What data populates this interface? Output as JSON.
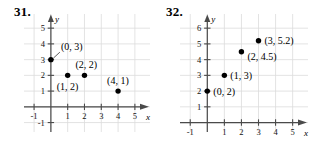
{
  "figures": [
    {
      "number": "31.",
      "chart_data": {
        "type": "scatter",
        "title": "",
        "xlabel": "x",
        "ylabel": "y",
        "grid": true,
        "legend": "none",
        "xlim": [
          -1.6,
          5.9
        ],
        "ylim": [
          -1.6,
          5.9
        ],
        "xticks": [
          -1,
          1,
          2,
          3,
          4,
          5
        ],
        "xtick_labels": [
          "-1",
          "1",
          "2",
          "3",
          "4",
          "5"
        ],
        "yticks": [
          -1,
          1,
          2,
          3,
          4,
          5
        ],
        "ytick_labels": [
          "-1",
          "1",
          "2",
          "3",
          "4",
          "5"
        ],
        "points": [
          {
            "x": 0,
            "y": 3,
            "label": "(0, 3)",
            "label_dx": 10,
            "label_dy": -10,
            "leader": true
          },
          {
            "x": 1,
            "y": 2,
            "label": "(1, 2)",
            "label_dx": -11,
            "label_dy": 15,
            "leader": false
          },
          {
            "x": 2,
            "y": 2,
            "label": "(2, 2)",
            "label_dx": -9,
            "label_dy": -7,
            "leader": false
          },
          {
            "x": 4,
            "y": 1,
            "label": "(4, 1)",
            "label_dx": -11,
            "label_dy": -7,
            "leader": false
          }
        ]
      }
    },
    {
      "number": "32.",
      "chart_data": {
        "type": "scatter",
        "title": "",
        "xlabel": "x",
        "ylabel": "y",
        "grid": true,
        "legend": "none",
        "xlim": [
          -1.6,
          5.9
        ],
        "ylim": [
          -0.6,
          6.9
        ],
        "xticks": [
          -1,
          1,
          2,
          3,
          4,
          5
        ],
        "xtick_labels": [
          "-1",
          "1",
          "2",
          "3",
          "4",
          "5"
        ],
        "yticks": [
          1,
          2,
          3,
          4,
          5,
          6
        ],
        "ytick_labels": [
          "1",
          "2",
          "3",
          "4",
          "5",
          "6"
        ],
        "points": [
          {
            "x": 0,
            "y": 2,
            "label": "(0, 2)",
            "label_dx": 6,
            "label_dy": 4,
            "leader": false
          },
          {
            "x": 1,
            "y": 3,
            "label": "(1, 3)",
            "label_dx": 6,
            "label_dy": 4,
            "leader": false
          },
          {
            "x": 2,
            "y": 4.5,
            "label": "(2, 4.5)",
            "label_dx": 6,
            "label_dy": 8,
            "leader": false
          },
          {
            "x": 3,
            "y": 5.2,
            "label": "(3, 5.2)",
            "label_dx": 6,
            "label_dy": 3,
            "leader": false
          }
        ]
      }
    }
  ]
}
